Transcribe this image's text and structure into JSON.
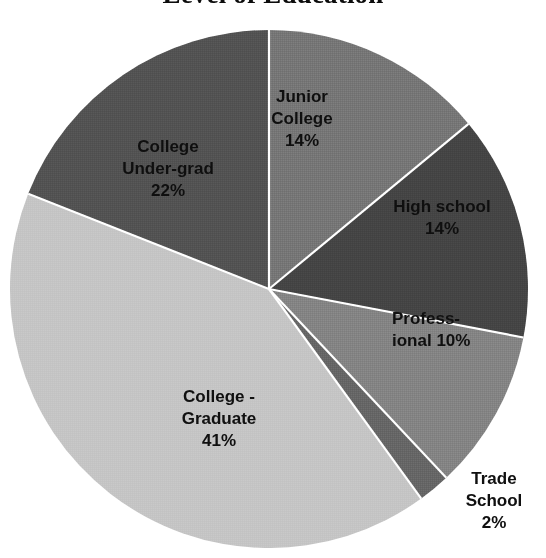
{
  "chart_data": {
    "type": "pie",
    "title": "Level of Education",
    "subtitle": "",
    "xlabel": "",
    "ylabel": "",
    "grid": false,
    "legend_position": "none",
    "label_format": "category + percent",
    "start_angle_deg": 0,
    "direction": "clockwise",
    "categories": [
      "Junior College",
      "High school",
      "Professional",
      "Trade School",
      "College - Graduate",
      "College Under-grad"
    ],
    "values": [
      14,
      14,
      10,
      2,
      41,
      22
    ],
    "value_unit": "%",
    "total": 103,
    "slices": [
      {
        "name": "Junior College",
        "label_text": "Junior\nCollege\n14%",
        "value": 14,
        "value_text": "14%",
        "color": "#7f7f7f",
        "start_deg": 0,
        "end_deg": 50.4,
        "label_placement": "inside"
      },
      {
        "name": "High school",
        "label_text": "High school\n14%",
        "value": 14,
        "value_text": "14%",
        "color": "#4a4a4a",
        "start_deg": 50.4,
        "end_deg": 100.8,
        "label_placement": "inside"
      },
      {
        "name": "Professional",
        "label_text": "Profess-\nional 10%",
        "value": 10,
        "value_text": "10%",
        "color": "#8c8c8c",
        "start_deg": 100.8,
        "end_deg": 136.8,
        "label_placement": "inside"
      },
      {
        "name": "Trade School",
        "label_text": "Trade\nSchool\n2%",
        "value": 2,
        "value_text": "2%",
        "color": "#6e6e6e",
        "start_deg": 136.8,
        "end_deg": 144.0,
        "label_placement": "outside"
      },
      {
        "name": "College - Graduate",
        "label_text": "College -\nGraduate\n41%",
        "value": 41,
        "value_text": "41%",
        "color": "#c9c9c9",
        "start_deg": 144.0,
        "end_deg": 291.6,
        "label_placement": "inside"
      },
      {
        "name": "College Under-grad",
        "label_text": "College\nUnder-grad\n22%",
        "value": 22,
        "value_text": "22%",
        "color": "#595959",
        "start_deg": 291.6,
        "end_deg": 360.0,
        "label_placement": "inside"
      }
    ],
    "geometry": {
      "center_x": 269,
      "center_y": 289,
      "radius": 259,
      "separator_color": "#ffffff",
      "separator_width": 2
    },
    "background_color": "#ffffff",
    "text_color": "#111111"
  }
}
